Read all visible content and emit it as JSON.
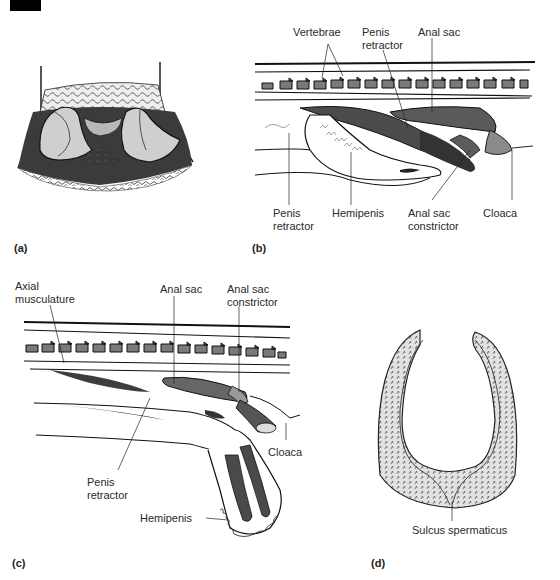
{
  "figure": {
    "panels": [
      {
        "id": "a",
        "letter": "(a)",
        "description": "Ventral view of everted hemipenes at tail base"
      },
      {
        "id": "b",
        "letter": "(b)",
        "labels": {
          "vertebrae": "Vertebrae",
          "penis_retractor_top": "Penis\nretractor",
          "anal_sac": "Anal sac",
          "penis_retractor_bottom": "Penis\nretractor",
          "hemipenis": "Hemipenis",
          "anal_sac_constrictor": "Anal sac\nconstrictor",
          "cloaca": "Cloaca"
        }
      },
      {
        "id": "c",
        "letter": "(c)",
        "labels": {
          "axial_musculature": "Axial\nmusculature",
          "anal_sac": "Anal sac",
          "anal_sac_constrictor": "Anal sac\nconstrictor",
          "cloaca": "Cloaca",
          "penis_retractor": "Penis\nretractor",
          "hemipenis": "Hemipenis"
        }
      },
      {
        "id": "d",
        "letter": "(d)",
        "labels": {
          "sulcus_spermaticus": "Sulcus spermaticus"
        }
      }
    ]
  },
  "colors": {
    "ink": "#1a1a1a",
    "shade_dark": "#4a4a4a",
    "shade_mid": "#8a8a8a",
    "shade_light": "#c8c8c8",
    "background": "#ffffff"
  }
}
